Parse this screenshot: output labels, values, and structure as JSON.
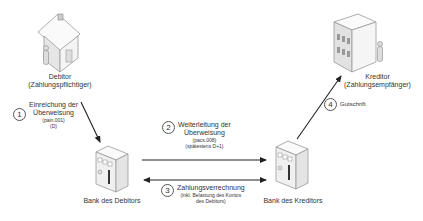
{
  "parties": {
    "debitor": {
      "name": "Debitor",
      "role": "(Zahlungspflichtiger)",
      "icon": "house-icon"
    },
    "kreditor": {
      "name": "Kreditor",
      "role": "(Zahlungsempfänger)",
      "icon": "office-building-icon"
    },
    "bank_debitor": {
      "name": "Bank des Debitors",
      "icon": "bank-icon"
    },
    "bank_kreditor": {
      "name": "Bank des Kreditors",
      "icon": "bank-icon"
    }
  },
  "steps": [
    {
      "number": "1",
      "title_line1": "Einreichung der",
      "title_line2": "Überweisung",
      "detail_line1": "(pain.001)",
      "detail_line2": "(D)"
    },
    {
      "number": "2",
      "title_line1": "Weiterleitung der",
      "title_line2": "Überweisung",
      "detail_line1": "(pacs.008)",
      "detail_line2": "(spätestens D+1)"
    },
    {
      "number": "3",
      "title_line1": "Zahlungsverrechnung",
      "detail_line1": "(inkl. Belastung des Kontos",
      "detail_line2": "des Debitors)"
    },
    {
      "number": "4",
      "title_line1": "Gutschrift"
    }
  ],
  "colors": {
    "line": "#222222",
    "icon_fill": "#f2f2f2",
    "icon_stroke": "#777777"
  }
}
